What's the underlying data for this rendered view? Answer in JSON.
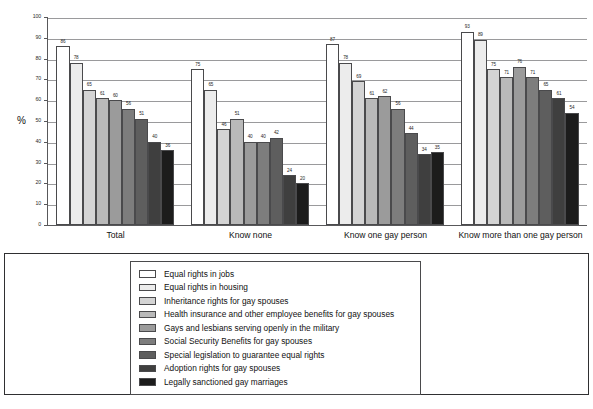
{
  "chart_data": {
    "type": "bar",
    "title": "",
    "xlabel": "",
    "ylabel": "%",
    "ylim": [
      0,
      100
    ],
    "yticks": [
      0,
      10,
      20,
      30,
      40,
      50,
      60,
      70,
      80,
      90,
      100
    ],
    "grid": true,
    "legend_position": "bottom",
    "categories": [
      "Total",
      "Know none",
      "Know one gay person",
      "Know more than one gay person"
    ],
    "series": [
      {
        "name": "Equal rights in jobs",
        "color": "#ffffff",
        "values": [
          86,
          75,
          87,
          93
        ]
      },
      {
        "name": "Equal rights in housing",
        "color": "#ececec",
        "values": [
          78,
          65,
          78,
          89
        ]
      },
      {
        "name": "Inheritance rights for gay spouses",
        "color": "#d4d4d4",
        "values": [
          65,
          46,
          69,
          75
        ]
      },
      {
        "name": "Health insurance and other employee benefits for gay spouses",
        "color": "#b9b9b9",
        "values": [
          61,
          51,
          61,
          71
        ]
      },
      {
        "name": "Gays and lesbians serving openly in the military",
        "color": "#9b9b9b",
        "values": [
          60,
          40,
          62,
          76
        ]
      },
      {
        "name": "Social Security Benefits for gay spouses",
        "color": "#7d7d7d",
        "values": [
          56,
          40,
          56,
          71
        ]
      },
      {
        "name": "Special legislation to guarantee equal rights",
        "color": "#5e5e5e",
        "values": [
          51,
          42,
          44,
          65
        ]
      },
      {
        "name": "Adoption rights for gay spouses",
        "color": "#3f3f3f",
        "values": [
          40,
          24,
          34,
          61
        ]
      },
      {
        "name": "Legally sanctioned gay marriages",
        "color": "#1c1c1c",
        "values": [
          36,
          20,
          35,
          54
        ]
      }
    ]
  }
}
